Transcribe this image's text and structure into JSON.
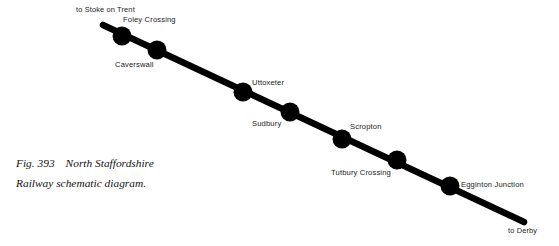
{
  "figure": {
    "number": "Fig. 393",
    "title_line_1": "North Staffordshire",
    "title_line_2": "Railway schematic diagram.",
    "caption_full": "Fig. 393   North Staffordshire Railway schematic diagram."
  },
  "diagram": {
    "type": "railway-schematic",
    "line_color": "#000000",
    "station_color": "#000000",
    "text_color": "#1a1a1a",
    "background_color": "#ffffff",
    "route_start": {
      "x": 103,
      "y": 25
    },
    "route_end": {
      "x": 524,
      "y": 222
    },
    "line_width": 6.5,
    "station_radius": 9.5
  },
  "termini": [
    {
      "id": "stoke-on-trent",
      "label": "to Stoke on Trent",
      "x": 76,
      "y": 5,
      "end": "start"
    },
    {
      "id": "derby",
      "label": "to Derby",
      "x": 508,
      "y": 226,
      "end": "end"
    }
  ],
  "stations": [
    {
      "id": "foley-crossing",
      "label": "Foley Crossing",
      "dot": {
        "x": 122,
        "y": 36
      },
      "label_pos": {
        "x": 123,
        "y": 15
      },
      "label_side": "above-right"
    },
    {
      "id": "caverswall",
      "label": "Caverswall",
      "dot": {
        "x": 157,
        "y": 50
      },
      "label_pos": {
        "x": 115,
        "y": 60
      },
      "label_side": "below-left"
    },
    {
      "id": "uttoxeter",
      "label": "Uttoxeter",
      "dot": {
        "x": 243,
        "y": 92
      },
      "label_pos": {
        "x": 252,
        "y": 78
      },
      "label_side": "above-right"
    },
    {
      "id": "sudbury",
      "label": "Sudbury",
      "dot": {
        "x": 290,
        "y": 112
      },
      "label_pos": {
        "x": 252,
        "y": 119
      },
      "label_side": "below-left"
    },
    {
      "id": "scropton",
      "label": "Scropton",
      "dot": {
        "x": 342,
        "y": 139
      },
      "label_pos": {
        "x": 350,
        "y": 122
      },
      "label_side": "above-right"
    },
    {
      "id": "tutbury-crossing",
      "label": "Tutbury Crossing",
      "dot": {
        "x": 397,
        "y": 160
      },
      "label_pos": {
        "x": 331,
        "y": 168
      },
      "label_side": "below-left"
    },
    {
      "id": "egginton-junction",
      "label": "Egginton Junction",
      "dot": {
        "x": 450,
        "y": 186
      },
      "label_pos": {
        "x": 461,
        "y": 180
      },
      "label_side": "right"
    }
  ]
}
